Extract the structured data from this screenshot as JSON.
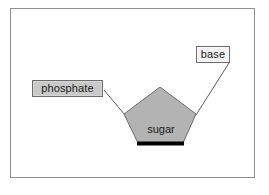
{
  "figure": {
    "background_color": "#ffffff",
    "frame_color": "#8e8e93"
  },
  "shapes": {
    "sugar_pentagon": {
      "label": "sugar",
      "fill_color": "#b3b3b3",
      "stroke_color": "#6b6b6b",
      "base_edge_color": "#000000",
      "points": "160,87 196,114 183,144 138,144 124,114"
    }
  },
  "labels": {
    "phosphate": {
      "text": "phosphate",
      "fill_color": "#c9c9c9",
      "border_color": "#6b6b6b"
    },
    "base": {
      "text": "base",
      "fill_color": "#f2f2f2",
      "border_color": "#6b6b6b"
    },
    "sugar": {
      "text": "sugar"
    }
  },
  "connectors": [
    {
      "name": "phosphate-to-sugar",
      "from": "phosphate",
      "to": "sugar-left-vertex",
      "color": "#5a5a5a"
    },
    {
      "name": "base-to-sugar",
      "from": "base",
      "to": "sugar-right-vertex",
      "color": "#5a5a5a"
    }
  ]
}
